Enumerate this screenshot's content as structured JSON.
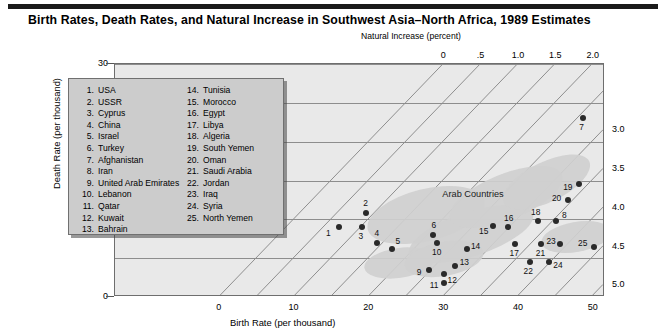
{
  "title": "Birth Rates, Death Rates, and Natural Increase in Southwest Asia–North Africa, 1989 Estimates",
  "axes": {
    "y_label": "Death Rate (per thousand)",
    "x_label": "Birth Rate (per thousand)",
    "top_label": "Natural Increase (percent)",
    "y_ticks": [
      "0",
      "10",
      "20",
      "30"
    ],
    "x_ticks": [
      "0",
      "10",
      "20",
      "30",
      "40",
      "50"
    ],
    "top_ticks": [
      "0",
      ".5",
      "1.0",
      "1.5",
      "2.0",
      "2.5"
    ],
    "right_ticks": [
      "3.0",
      "3.5",
      "4.0",
      "4.5",
      "5.0"
    ]
  },
  "annotations": {
    "arab_countries": "Arab Countries"
  },
  "colors": {
    "plot_background": "#e9e9e9",
    "legend_background": "#cccccc",
    "blob": "#cfcfcf",
    "point": "#2a2a2a",
    "gridline": "#8d8d8d",
    "title_rule": "#1a1a1a"
  },
  "legend": {
    "column_a": [
      {
        "num": "1.",
        "name": "USA"
      },
      {
        "num": "2.",
        "name": "USSR"
      },
      {
        "num": "3.",
        "name": "Cyprus"
      },
      {
        "num": "4.",
        "name": "China"
      },
      {
        "num": "5.",
        "name": "Israel"
      },
      {
        "num": "6.",
        "name": "Turkey"
      },
      {
        "num": "7.",
        "name": "Afghanistan"
      },
      {
        "num": "8.",
        "name": "Iran"
      },
      {
        "num": "9.",
        "name": "United Arab Emirates"
      },
      {
        "num": "10.",
        "name": "Lebanon"
      },
      {
        "num": "11.",
        "name": "Qatar"
      },
      {
        "num": "12.",
        "name": "Kuwait"
      },
      {
        "num": "13.",
        "name": "Bahrain"
      }
    ],
    "column_b": [
      {
        "num": "14.",
        "name": "Tunisia"
      },
      {
        "num": "15.",
        "name": "Morocco"
      },
      {
        "num": "16.",
        "name": "Egypt"
      },
      {
        "num": "17.",
        "name": "Libya"
      },
      {
        "num": "18.",
        "name": "Algeria"
      },
      {
        "num": "19.",
        "name": "South Yemen"
      },
      {
        "num": "20.",
        "name": "Oman"
      },
      {
        "num": "21.",
        "name": "Saudi Arabia"
      },
      {
        "num": "22.",
        "name": "Jordan"
      },
      {
        "num": "23.",
        "name": "Iraq"
      },
      {
        "num": "24.",
        "name": "Syria"
      },
      {
        "num": "25.",
        "name": "North Yemen"
      }
    ]
  },
  "chart_data": {
    "type": "scatter",
    "title": "Birth Rates, Death Rates, and Natural Increase in Southwest Asia–North Africa, 1989 Estimates",
    "xlabel": "Birth Rate (per thousand)",
    "ylabel": "Death Rate (per thousand)",
    "xlim": [
      -14,
      51.5
    ],
    "ylim": [
      0,
      30
    ],
    "x_ticks": [
      0,
      10,
      20,
      30,
      40,
      50
    ],
    "y_ticks": [
      0,
      10,
      20,
      30
    ],
    "gridlines_y": [
      5,
      10,
      15,
      20,
      25
    ],
    "grid": true,
    "legend_position": "inside-upper-left",
    "diagonal_scale": {
      "name": "Natural Increase (percent)",
      "description": "Diagonal lines of constant natural increase = (birth rate - death rate)/10 percent",
      "top_axis_values": [
        0,
        0.5,
        1.0,
        1.5,
        2.0,
        2.5
      ],
      "right_axis_values": [
        3.0,
        3.5,
        4.0,
        4.5,
        5.0
      ]
    },
    "points": [
      {
        "id": 1,
        "name": "USA",
        "birth_rate": 16.0,
        "death_rate": 9.0,
        "label_dx": -11,
        "label_dy": 6
      },
      {
        "id": 2,
        "name": "USSR",
        "birth_rate": 19.5,
        "death_rate": 10.8,
        "label_dx": 0,
        "label_dy": -10
      },
      {
        "id": 3,
        "name": "Cyprus",
        "birth_rate": 19.0,
        "death_rate": 9.0,
        "label_dx": -1,
        "label_dy": 9
      },
      {
        "id": 4,
        "name": "China",
        "birth_rate": 21.0,
        "death_rate": 7.0,
        "label_dx": 0,
        "label_dy": -10
      },
      {
        "id": 5,
        "name": "Israel",
        "birth_rate": 23.0,
        "death_rate": 6.2,
        "label_dx": 6,
        "label_dy": -8
      },
      {
        "id": 6,
        "name": "Turkey",
        "birth_rate": 28.5,
        "death_rate": 8.0,
        "label_dx": 1,
        "label_dy": -10
      },
      {
        "id": 7,
        "name": "Afghanistan",
        "birth_rate": 48.5,
        "death_rate": 23.0,
        "label_dx": -1,
        "label_dy": 9
      },
      {
        "id": 8,
        "name": "Iran",
        "birth_rate": 45.0,
        "death_rate": 9.8,
        "label_dx": 8,
        "label_dy": -6
      },
      {
        "id": 9,
        "name": "United Arab Emirates",
        "birth_rate": 28.0,
        "death_rate": 3.5,
        "label_dx": -10,
        "label_dy": 2
      },
      {
        "id": 10,
        "name": "Lebanon",
        "birth_rate": 29.0,
        "death_rate": 7.0,
        "label_dx": 0,
        "label_dy": 9
      },
      {
        "id": 11,
        "name": "Qatar",
        "birth_rate": 30.0,
        "death_rate": 1.8,
        "label_dx": -10,
        "label_dy": 2
      },
      {
        "id": 12,
        "name": "Kuwait",
        "birth_rate": 30.0,
        "death_rate": 3.0,
        "label_dx": 8,
        "label_dy": 6
      },
      {
        "id": 13,
        "name": "Bahrain",
        "birth_rate": 31.5,
        "death_rate": 4.0,
        "label_dx": 9,
        "label_dy": -4
      },
      {
        "id": 14,
        "name": "Tunisia",
        "birth_rate": 33.0,
        "death_rate": 6.2,
        "label_dx": 9,
        "label_dy": -3
      },
      {
        "id": 15,
        "name": "Morocco",
        "birth_rate": 36.5,
        "death_rate": 9.2,
        "label_dx": -9,
        "label_dy": 5
      },
      {
        "id": 16,
        "name": "Egypt",
        "birth_rate": 38.5,
        "death_rate": 9.0,
        "label_dx": 1,
        "label_dy": -9
      },
      {
        "id": 17,
        "name": "Libya",
        "birth_rate": 39.5,
        "death_rate": 6.8,
        "label_dx": -1,
        "label_dy": 9
      },
      {
        "id": 18,
        "name": "Algeria",
        "birth_rate": 42.5,
        "death_rate": 9.8,
        "label_dx": -2,
        "label_dy": -9
      },
      {
        "id": 19,
        "name": "South Yemen",
        "birth_rate": 48.0,
        "death_rate": 14.5,
        "label_dx": -11,
        "label_dy": 3
      },
      {
        "id": 20,
        "name": "Oman",
        "birth_rate": 46.5,
        "death_rate": 12.5,
        "label_dx": -11,
        "label_dy": -2
      },
      {
        "id": 21,
        "name": "Saudi Arabia",
        "birth_rate": 43.0,
        "death_rate": 6.8,
        "label_dx": -1,
        "label_dy": 9
      },
      {
        "id": 22,
        "name": "Jordan",
        "birth_rate": 41.5,
        "death_rate": 4.5,
        "label_dx": -2,
        "label_dy": 9
      },
      {
        "id": 23,
        "name": "Iraq",
        "birth_rate": 45.5,
        "death_rate": 6.8,
        "label_dx": -9,
        "label_dy": -3
      },
      {
        "id": 24,
        "name": "Syria",
        "birth_rate": 44.0,
        "death_rate": 4.5,
        "label_dx": 9,
        "label_dy": 3
      },
      {
        "id": 25,
        "name": "North Yemen",
        "birth_rate": 50.0,
        "death_rate": 6.5,
        "label_dx": -11,
        "label_dy": -4
      }
    ]
  }
}
